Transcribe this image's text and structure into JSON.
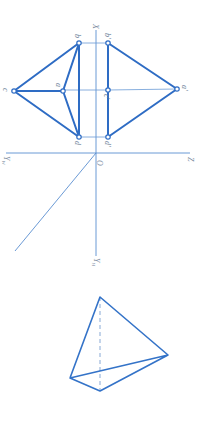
{
  "diagram": {
    "orientation_note": "rotated 90 degrees clockwise",
    "colors": {
      "line": "#2e6cc4",
      "axis": "#5a8fd0",
      "label": "#6b7f99"
    },
    "axes": {
      "origin_label": "O",
      "x_label": "X",
      "z_label": "Z",
      "yw_label": "Y",
      "yw_sub": "W",
      "yh_label": "Y",
      "yh_sub": "H"
    },
    "points_horizontal": {
      "a": "a",
      "b": "b",
      "c": "c",
      "d": "d"
    },
    "points_vertical": {
      "a": "a'",
      "b": "b'",
      "c": "c'",
      "d": "d'"
    }
  }
}
